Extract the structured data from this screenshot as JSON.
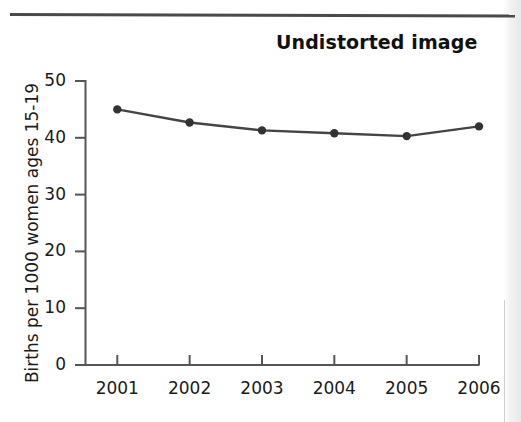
{
  "page": {
    "title": "Undistorted image"
  },
  "chart_data": {
    "type": "line",
    "title": "Undistorted image",
    "xlabel": "",
    "ylabel": "Births per 1000 women ages 15-19",
    "categories": [
      "2001",
      "2002",
      "2003",
      "2004",
      "2005",
      "2006"
    ],
    "values": [
      45.0,
      42.7,
      41.3,
      40.8,
      40.3,
      42.0
    ],
    "x": [
      2001,
      2002,
      2003,
      2004,
      2005,
      2006
    ],
    "ylim": [
      0,
      50
    ],
    "yticks": [
      0,
      10,
      20,
      30,
      40,
      50
    ],
    "ytick_labels": [
      "0",
      "10",
      "20",
      "30",
      "40",
      "50"
    ],
    "xtick_labels": [
      "2001",
      "2002",
      "2003",
      "2004",
      "2005",
      "2006"
    ],
    "grid": false,
    "legend": false,
    "marker": "circle",
    "line_color": "#444444",
    "marker_color": "#333333",
    "axis_color": "#555555"
  },
  "decor": {
    "rule_color": "#4a4a4a"
  }
}
